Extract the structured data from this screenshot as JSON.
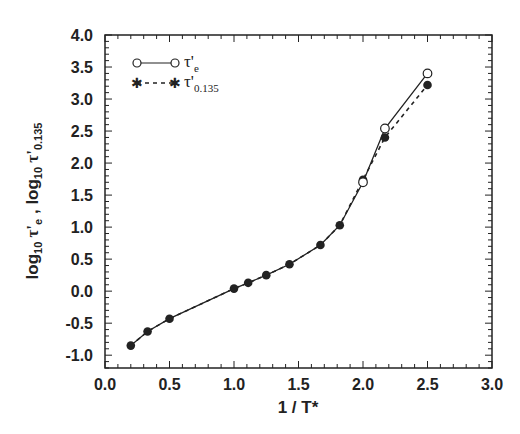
{
  "chart_data": {
    "type": "line",
    "title": "",
    "xlabel": "1 / T*",
    "ylabel": "log10 τ'e , log10 τ'0.135",
    "xlim": [
      0.0,
      3.0
    ],
    "ylim": [
      -1.2,
      4.0
    ],
    "xticks": [
      "0.0",
      "0.5",
      "1.0",
      "1.5",
      "2.0",
      "2.5",
      "3.0"
    ],
    "yticks": [
      "-1.0",
      "-0.5",
      "0.0",
      "0.5",
      "1.0",
      "1.5",
      "2.0",
      "2.5",
      "3.0",
      "3.5",
      "4.0"
    ],
    "grid": false,
    "legend_position": "upper left",
    "series": [
      {
        "name": "τ'e",
        "marker": "open-circle",
        "line": "solid",
        "x": [
          0.2,
          0.33,
          0.5,
          1.0,
          1.11,
          1.25,
          1.43,
          1.67,
          1.82,
          2.0,
          2.17,
          2.5
        ],
        "y": [
          -0.85,
          -0.63,
          -0.43,
          0.04,
          0.13,
          0.25,
          0.42,
          0.72,
          1.03,
          1.7,
          2.54,
          3.4
        ]
      },
      {
        "name": "τ'0.135",
        "marker": "filled-star",
        "line": "dashed",
        "x": [
          0.2,
          0.33,
          0.5,
          1.0,
          1.11,
          1.25,
          1.43,
          1.67,
          1.82,
          2.0,
          2.17,
          2.5
        ],
        "y": [
          -0.85,
          -0.63,
          -0.43,
          0.04,
          0.13,
          0.25,
          0.42,
          0.72,
          1.03,
          1.74,
          2.4,
          3.22
        ]
      }
    ]
  },
  "labels": {
    "xlabel": "1 / T*",
    "ylabel_part1": "log",
    "ylabel_sub1": "10",
    "ylabel_tau1": " τ'",
    "ylabel_tausub1": "e",
    "ylabel_sep": " ,  ",
    "ylabel_part2": "log",
    "ylabel_sub2": "10",
    "ylabel_tau2": " τ'",
    "ylabel_tausub2": "0.135",
    "legend_tau": "τ'",
    "legend_sub1": "e",
    "legend_sub2": "0.135"
  },
  "colors": {
    "ink": "#222222",
    "background": "#ffffff"
  }
}
